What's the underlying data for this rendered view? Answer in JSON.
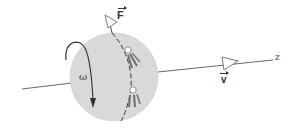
{
  "diagram": {
    "labels": {
      "omega": "ω",
      "force": "F",
      "velocity": "v",
      "axis": "z"
    },
    "colors": {
      "sphere_fill": "#d9d9d9",
      "line": "#555555",
      "arrow_head_fill": "#ffffff",
      "thruster_plume": "#6e6e6e",
      "text": "#333333"
    },
    "elements": {
      "sphere": {
        "cx": 114,
        "cy": 77,
        "r": 44
      },
      "axis_line": {
        "from": [
          22,
          89
        ],
        "to": [
          273,
          60
        ]
      },
      "velocity_arrow": {
        "at": [
          228,
          63
        ]
      },
      "force_arrow": {
        "at": [
          110,
          20
        ]
      },
      "rotation_arrow": "curved arrow from left of sphere, over top, down through sphere",
      "thrusters": 2
    }
  }
}
